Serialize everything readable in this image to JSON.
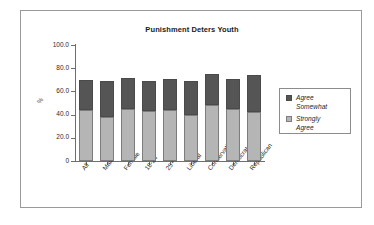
{
  "chart_data": {
    "type": "bar",
    "subtype": "stacked-bar",
    "title": "Punishment Deters Youth",
    "xlabel": "",
    "ylabel": "%",
    "ylim": [
      0,
      100
    ],
    "ytick_labels": [
      "0",
      "20.0",
      "40.0",
      "60.0",
      "80.0",
      "100.0"
    ],
    "ytick_values": [
      0,
      20,
      40,
      60,
      80,
      100
    ],
    "grid": false,
    "legend_position": "right",
    "categories": [
      "All",
      "Male",
      "Female",
      "18-24",
      "25+",
      "Liberal",
      "Conservative",
      "Democrat",
      "Republican"
    ],
    "series": [
      {
        "name": "Strongly Agree",
        "color": "#b5b5b5",
        "values": [
          44,
          38,
          45,
          43,
          44,
          40,
          48,
          45,
          42
        ]
      },
      {
        "name": "Agree Somewhat",
        "color": "#555555",
        "values": [
          26,
          31,
          27,
          26,
          27,
          29,
          27,
          26,
          32
        ]
      }
    ],
    "totals": [
      70,
      69,
      72,
      69,
      71,
      69,
      75,
      71,
      74
    ]
  },
  "legend": {
    "items": [
      {
        "label": "Agree\nSomewhat",
        "swatch": "dark"
      },
      {
        "label": "Strongly\nAgree",
        "swatch": "light"
      }
    ]
  }
}
